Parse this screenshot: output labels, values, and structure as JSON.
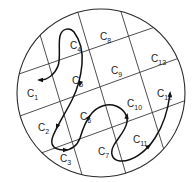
{
  "diagram": {
    "type": "cell-partitioned circular region with trajectory",
    "boundary": {
      "shape": "circle",
      "cx": 101,
      "cy": 93,
      "r": 84,
      "color": "#2a2a2a"
    },
    "grid_lines": [
      {
        "id": "h1",
        "x1": 19,
        "y1": 74,
        "x2": 158,
        "y2": 26
      },
      {
        "id": "h2",
        "x1": 20,
        "y1": 116,
        "x2": 182,
        "y2": 57
      },
      {
        "id": "h3",
        "x1": 44,
        "y1": 152,
        "x2": 184,
        "y2": 101
      },
      {
        "id": "v1",
        "x1": 41,
        "y1": 38,
        "x2": 80,
        "y2": 168
      },
      {
        "id": "v2",
        "x1": 79,
        "y1": 16,
        "x2": 126,
        "y2": 174
      },
      {
        "id": "v3",
        "x1": 122,
        "y1": 15,
        "x2": 164,
        "y2": 150
      }
    ],
    "cells": [
      {
        "label": "C",
        "sub": "1",
        "x": 27,
        "y": 97
      },
      {
        "label": "C",
        "sub": "2",
        "x": 38,
        "y": 131
      },
      {
        "label": "C",
        "sub": "3",
        "x": 60,
        "y": 162
      },
      {
        "label": "C",
        "sub": "4",
        "x": 70,
        "y": 49
      },
      {
        "label": "C",
        "sub": "5",
        "x": 72,
        "y": 84
      },
      {
        "label": "C",
        "sub": "6",
        "x": 80,
        "y": 120
      },
      {
        "label": "C",
        "sub": "7",
        "x": 98,
        "y": 155
      },
      {
        "label": "C",
        "sub": "8",
        "x": 100,
        "y": 40
      },
      {
        "label": "C",
        "sub": "9",
        "x": 111,
        "y": 74
      },
      {
        "label": "C",
        "sub": "10",
        "x": 127,
        "y": 107
      },
      {
        "label": "C",
        "sub": "11",
        "x": 133,
        "y": 143
      },
      {
        "label": "C",
        "sub": "12",
        "x": 157,
        "y": 97
      },
      {
        "label": "C",
        "sub": "13",
        "x": 151,
        "y": 62
      }
    ],
    "trajectory": {
      "color": "#111111",
      "path": "M40,80 C48,80 55,74 58,66 C61,58 58,45 60,36 C62,28 70,27 74,32 C80,40 83,52 82,64 C81,76 78,88 72,100 C66,112 58,124 53,136 C49,146 55,150 64,150 C72,150 77,146 80,138 C83,128 86,120 92,113 C98,106 108,103 116,106 C124,109 128,116 127,122 C126,130 118,138 114,145 C110,152 111,160 120,161 C132,162 146,152 155,138 C163,126 168,110 170,94",
      "arrows": [
        {
          "x": 40,
          "y": 80,
          "angle": 180
        },
        {
          "x": 80,
          "y": 84,
          "angle": 105
        },
        {
          "x": 57,
          "y": 127,
          "angle": 112
        },
        {
          "x": 66,
          "y": 150,
          "angle": 0
        },
        {
          "x": 89,
          "y": 117,
          "angle": -55
        },
        {
          "x": 127,
          "y": 116,
          "angle": -80
        },
        {
          "x": 149,
          "y": 146,
          "angle": -40
        },
        {
          "x": 170,
          "y": 94,
          "angle": -85
        }
      ]
    }
  }
}
